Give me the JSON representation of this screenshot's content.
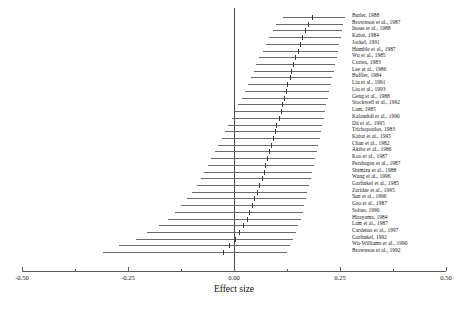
{
  "chart_data": {
    "type": "forest",
    "title": "",
    "xlabel": "Effect size",
    "ylabel": "",
    "xlim": [
      -0.5,
      0.5
    ],
    "grid": false,
    "legend": null,
    "reference_line": 0.0,
    "tick_labels": [
      "-0.50",
      "-0.25",
      "0.00",
      "0.25",
      "0.50"
    ],
    "tick_values": [
      -0.5,
      -0.25,
      0.0,
      0.25,
      0.5
    ],
    "minor_tick_values": [
      -0.375,
      -0.125,
      0.125,
      0.375
    ],
    "studies": [
      {
        "label": "Butler, 1988",
        "effect": 0.185,
        "low": 0.115,
        "high": 0.262
      },
      {
        "label": "Brownson et al., 1987",
        "effect": 0.175,
        "low": 0.1,
        "high": 0.258
      },
      {
        "label": "Inoue et al., 1988",
        "effect": 0.168,
        "low": 0.092,
        "high": 0.255
      },
      {
        "label": "Kabat, 1984",
        "effect": 0.16,
        "low": 0.083,
        "high": 0.252
      },
      {
        "label": "Jockel, 1991",
        "effect": 0.155,
        "low": 0.076,
        "high": 0.248
      },
      {
        "label": "Humble et al., 1987",
        "effect": 0.15,
        "low": 0.068,
        "high": 0.245
      },
      {
        "label": "Wu et al., 1985",
        "effect": 0.145,
        "low": 0.06,
        "high": 0.242
      },
      {
        "label": "Correa, 1983",
        "effect": 0.14,
        "low": 0.053,
        "high": 0.238
      },
      {
        "label": "Lee et al., 1986",
        "effect": 0.135,
        "low": 0.046,
        "high": 0.235
      },
      {
        "label": "Buffler, 1984",
        "effect": 0.132,
        "low": 0.04,
        "high": 0.232
      },
      {
        "label": "Liu et al., 1991",
        "effect": 0.126,
        "low": 0.032,
        "high": 0.228
      },
      {
        "label": "Liu et al., 1993",
        "effect": 0.122,
        "low": 0.025,
        "high": 0.225
      },
      {
        "label": "Geng et al., 1988",
        "effect": 0.118,
        "low": 0.018,
        "high": 0.222
      },
      {
        "label": "Stockwell et al., 1992",
        "effect": 0.114,
        "low": 0.01,
        "high": 0.218
      },
      {
        "label": "Lam, 1985",
        "effect": 0.11,
        "low": 0.003,
        "high": 0.215
      },
      {
        "label": "Kalandidi et al., 1990",
        "effect": 0.105,
        "low": -0.005,
        "high": 0.212
      },
      {
        "label": "Du et al., 1995",
        "effect": 0.1,
        "low": -0.013,
        "high": 0.208
      },
      {
        "label": "Trichopoulos, 1983",
        "effect": 0.096,
        "low": -0.021,
        "high": 0.205
      },
      {
        "label": "Kabat et al., 1995",
        "effect": 0.092,
        "low": -0.029,
        "high": 0.202
      },
      {
        "label": "Chan et al., 1982",
        "effect": 0.088,
        "low": -0.037,
        "high": 0.198
      },
      {
        "label": "Akiba et al., 1986",
        "effect": 0.083,
        "low": -0.045,
        "high": 0.195
      },
      {
        "label": "Koo et al., 1987",
        "effect": 0.078,
        "low": -0.054,
        "high": 0.191
      },
      {
        "label": "Pershagen et al., 1987",
        "effect": 0.074,
        "low": -0.062,
        "high": 0.188
      },
      {
        "label": "Shimizu et al., 1988",
        "effect": 0.07,
        "low": -0.07,
        "high": 0.184
      },
      {
        "label": "Wang et al., 1996",
        "effect": 0.065,
        "low": -0.079,
        "high": 0.181
      },
      {
        "label": "Garfinkel et al., 1985",
        "effect": 0.06,
        "low": -0.088,
        "high": 0.177
      },
      {
        "label": "Zaridze et al., 1995",
        "effect": 0.055,
        "low": -0.098,
        "high": 0.173
      },
      {
        "label": "Sun et al., 1996",
        "effect": 0.048,
        "low": -0.112,
        "high": 0.17
      },
      {
        "label": "Gao et al., 1987",
        "effect": 0.042,
        "low": -0.126,
        "high": 0.166
      },
      {
        "label": "Sobue, 1990",
        "effect": 0.036,
        "low": -0.14,
        "high": 0.162
      },
      {
        "label": "Hirayama, 1984",
        "effect": 0.03,
        "low": -0.155,
        "high": 0.158
      },
      {
        "label": "Lam et al., 1987",
        "effect": 0.022,
        "low": -0.178,
        "high": 0.152
      },
      {
        "label": "Cardenas et al., 1997",
        "effect": 0.012,
        "low": -0.205,
        "high": 0.146
      },
      {
        "label": "Garfinkel, 1992",
        "effect": 0.002,
        "low": -0.232,
        "high": 0.14
      },
      {
        "label": "Wu-Williams et al., 1990",
        "effect": -0.012,
        "low": -0.272,
        "high": 0.132
      },
      {
        "label": "Brownson et al., 1992",
        "effect": -0.025,
        "low": -0.31,
        "high": 0.124
      }
    ]
  },
  "axis": {
    "title": "Effect size"
  },
  "colors": {
    "line": "#6b6b6b",
    "marker": "#3a3a3a",
    "axis": "#5a5a5a",
    "text": "#151515",
    "background": "#ffffff"
  }
}
